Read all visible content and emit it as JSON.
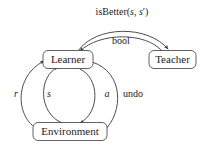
{
  "diagram": {
    "stroke_color": "#3a3a3a",
    "text_color": "#1c1c1c",
    "background_color": "#ffffff",
    "nodes": [
      {
        "id": "learner",
        "label": "Learner",
        "x": 68,
        "y": 60
      },
      {
        "id": "teacher",
        "label": "Teacher",
        "x": 173,
        "y": 60
      },
      {
        "id": "environment",
        "label": "Environment",
        "x": 70,
        "y": 132
      }
    ],
    "edges": [
      {
        "id": "is-better",
        "label": "isBetter(s, s')",
        "label_parts": [
          {
            "text": "isBetter(",
            "italic": false
          },
          {
            "text": "s",
            "italic": true
          },
          {
            "text": ", ",
            "italic": false
          },
          {
            "text": "s",
            "italic": true
          },
          {
            "text": "′)",
            "italic": false
          }
        ],
        "from": "learner",
        "to": "teacher",
        "label_x": 122,
        "label_y": 13
      },
      {
        "id": "bool",
        "label": "bool",
        "from": "teacher",
        "to": "learner",
        "label_x": 121,
        "label_y": 42
      },
      {
        "id": "reward",
        "label": "r",
        "italic": true,
        "from": "environment",
        "to": "learner",
        "label_x": 16,
        "label_y": 95
      },
      {
        "id": "state",
        "label": "s",
        "italic": true,
        "from": "environment",
        "to": "learner",
        "label_x": 49,
        "label_y": 95
      },
      {
        "id": "action",
        "label": "a",
        "italic": true,
        "from": "learner",
        "to": "environment",
        "label_x": 107,
        "label_y": 95
      },
      {
        "id": "undo",
        "label": "undo",
        "italic": false,
        "from": "learner",
        "to": "environment",
        "label_x": 133,
        "label_y": 95
      }
    ]
  }
}
